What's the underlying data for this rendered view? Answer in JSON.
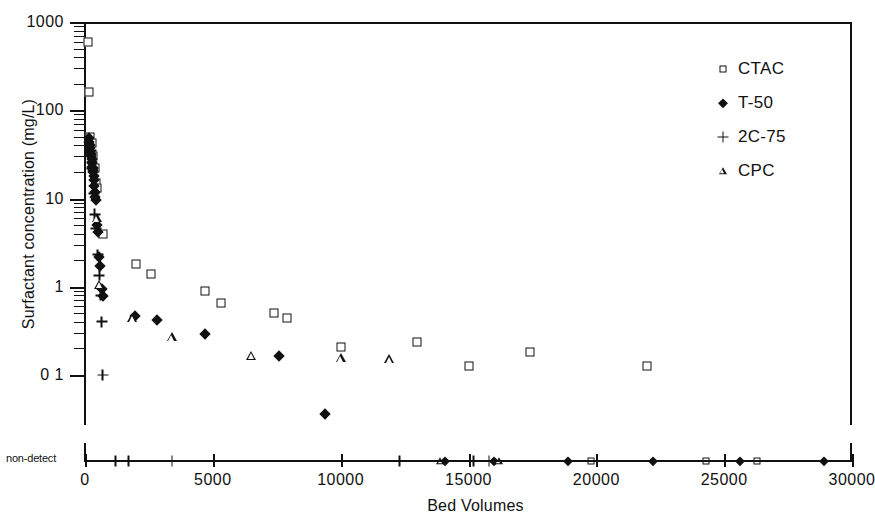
{
  "chart_data": {
    "type": "scatter",
    "title": "",
    "xlabel": "Bed Volumes",
    "ylabel": "Surfactant concentration (mg/L)",
    "yscale": "log",
    "xlim": [
      0,
      30000
    ],
    "ylim": [
      0.1,
      1000
    ],
    "xticks": [
      0,
      5000,
      10000,
      15000,
      20000,
      25000,
      30000
    ],
    "xtick_labels": [
      "0",
      "5000",
      "10000",
      "15000",
      "20000",
      "25000",
      "30000"
    ],
    "yticks": [
      1000,
      100,
      10,
      1,
      0.1
    ],
    "ytick_labels": [
      "1000",
      "100",
      "10",
      "1",
      "0 1"
    ],
    "grid": false,
    "legend_position": "top-right",
    "nondetect_axis_label": "non-detect",
    "series": [
      {
        "name": "CTAC",
        "marker": "open-square",
        "points": [
          [
            120,
            600
          ],
          [
            150,
            160
          ],
          [
            200,
            50
          ],
          [
            260,
            42
          ],
          [
            330,
            30
          ],
          [
            390,
            22
          ],
          [
            430,
            15
          ],
          [
            470,
            13
          ],
          [
            700,
            4.0
          ],
          [
            2000,
            1.8
          ],
          [
            2600,
            1.4
          ],
          [
            4700,
            0.9
          ],
          [
            5300,
            0.66
          ],
          [
            7400,
            0.5
          ],
          [
            7900,
            0.44
          ],
          [
            10000,
            0.205
          ],
          [
            13000,
            0.235
          ],
          [
            15000,
            0.125
          ],
          [
            17400,
            0.18
          ],
          [
            22000,
            0.127
          ]
        ],
        "nondetect_points": [
          19800,
          24300,
          26300
        ]
      },
      {
        "name": "T-50",
        "marker": "filled-diamond",
        "points": [
          [
            150,
            48
          ],
          [
            170,
            44
          ],
          [
            185,
            40
          ],
          [
            200,
            37
          ],
          [
            215,
            34
          ],
          [
            230,
            32
          ],
          [
            245,
            30
          ],
          [
            255,
            28
          ],
          [
            265,
            26
          ],
          [
            275,
            25
          ],
          [
            285,
            23
          ],
          [
            295,
            22
          ],
          [
            305,
            21
          ],
          [
            320,
            20
          ],
          [
            335,
            18
          ],
          [
            350,
            16
          ],
          [
            370,
            14
          ],
          [
            390,
            12
          ],
          [
            410,
            10.5
          ],
          [
            430,
            9.5
          ],
          [
            470,
            5.0
          ],
          [
            500,
            4.2
          ],
          [
            560,
            2.2
          ],
          [
            600,
            1.7
          ],
          [
            650,
            0.95
          ],
          [
            700,
            0.78
          ],
          [
            1950,
            0.47
          ],
          [
            2800,
            0.42
          ],
          [
            4700,
            0.295
          ],
          [
            7600,
            0.163
          ],
          [
            9400,
            0.036
          ]
        ],
        "nondetect_points": [
          14100,
          16000,
          18900,
          22200,
          25600,
          28900
        ]
      },
      {
        "name": "2C-75",
        "marker": "plus",
        "points": [
          [
            230,
            35
          ],
          [
            280,
            22
          ],
          [
            340,
            11.5
          ],
          [
            380,
            6.6
          ],
          [
            420,
            4.6
          ],
          [
            500,
            2.3
          ],
          [
            560,
            1.35
          ],
          [
            620,
            0.8
          ],
          [
            660,
            0.4
          ],
          [
            700,
            0.1
          ]
        ],
        "nondetect_points": [
          1200,
          1700,
          3400,
          12300,
          15200,
          15800
        ]
      },
      {
        "name": "CPC",
        "marker": "open-triangle",
        "points": [
          [
            470,
            6.0
          ],
          [
            560,
            1.05
          ],
          [
            1850,
            0.44
          ],
          [
            3400,
            0.27
          ],
          [
            6500,
            0.165
          ],
          [
            10000,
            0.155
          ],
          [
            11900,
            0.152
          ]
        ],
        "nondetect_points": [
          13900,
          16200
        ]
      }
    ]
  },
  "legend": {
    "items": [
      {
        "label": "CTAC",
        "marker": "open-square"
      },
      {
        "label": "T-50",
        "marker": "filled-diamond"
      },
      {
        "label": "2C-75",
        "marker": "plus"
      },
      {
        "label": "CPC",
        "marker": "open-triangle"
      }
    ]
  },
  "axes": {
    "x_title": "Bed Volumes",
    "y_title": "Surfactant concentration (mg/L)",
    "nondetect_label": "non-detect"
  },
  "colors": {
    "ink": "#111111",
    "background": "#ffffff"
  }
}
